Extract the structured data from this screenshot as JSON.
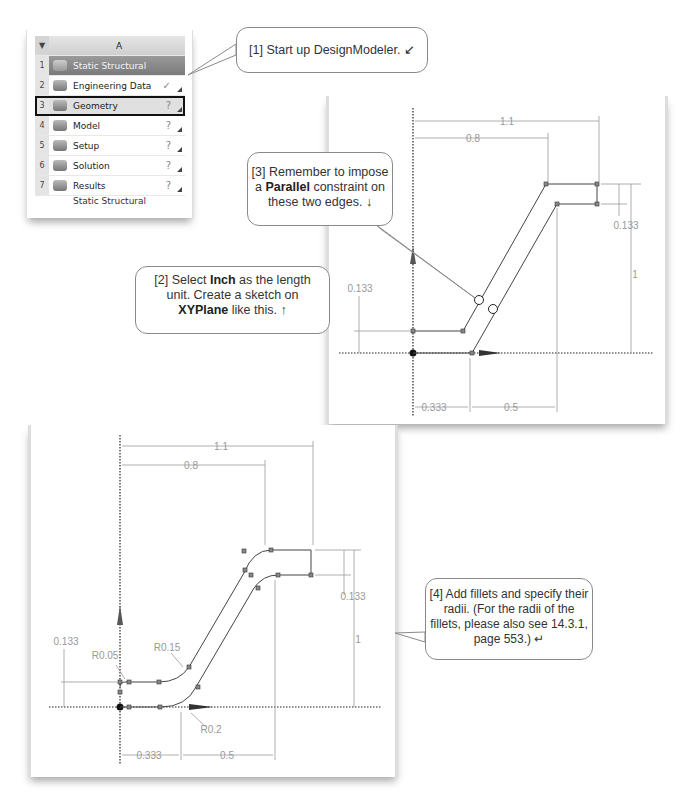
{
  "schematic": {
    "column_header": "A",
    "rows": [
      {
        "num": "1",
        "label": "Static Structural",
        "status": ""
      },
      {
        "num": "2",
        "label": "Engineering Data",
        "status": "✓"
      },
      {
        "num": "3",
        "label": "Geometry",
        "status": "?"
      },
      {
        "num": "4",
        "label": "Model",
        "status": "?"
      },
      {
        "num": "5",
        "label": "Setup",
        "status": "?"
      },
      {
        "num": "6",
        "label": "Solution",
        "status": "?"
      },
      {
        "num": "7",
        "label": "Results",
        "status": "?"
      }
    ],
    "caption": "Static Structural",
    "selected_row": "Geometry"
  },
  "callouts": {
    "c1": {
      "prefix": "[1] Start up DesignModeler.",
      "arrow": "↙"
    },
    "c2": {
      "line1_pre": "[2] Select ",
      "line1_bold": "Inch",
      "line1_post": " as the length",
      "line2": "unit.  Create a sketch on",
      "line3_bold": "XYPlane",
      "line3_post": " like this.",
      "arrow": "↑"
    },
    "c3": {
      "line1": "[3] Remember to impose",
      "line2_pre": "a ",
      "line2_bold": "Parallel",
      "line2_post": " constraint on",
      "line3": "these two edges.",
      "arrow": "↓"
    },
    "c4": {
      "line1": "[4] Add fillets and specify their",
      "line2": "radii.  (For the radii of the",
      "line3": "fillets, please also see 14.3.1,",
      "line4": "page 553.)",
      "arrow": "↵"
    }
  },
  "sketch1": {
    "dims": {
      "d_1_1": "1.1",
      "d_0_8": "0.8",
      "d_0_133_right": "0.133",
      "d_1": "1",
      "d_0_133_left": "0.133",
      "d_0_333": "0.333",
      "d_0_5": "0.5"
    }
  },
  "sketch2": {
    "dims": {
      "d_1_1": "1.1",
      "d_0_8": "0.8",
      "d_0_133_right": "0.133",
      "d_1": "1",
      "d_0_133_left": "0.133",
      "d_0_333": "0.333",
      "d_0_5": "0.5",
      "r_0_05": "R0.05",
      "r_0_15": "R0.15",
      "r_0_2": "R0.2"
    }
  }
}
